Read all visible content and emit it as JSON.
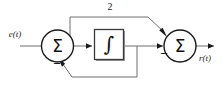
{
  "diagram": {
    "background_color": "#ffffff",
    "wire_color": "#6e6e6e",
    "outline_color": "#1a1a1a",
    "labels": {
      "input_signal": "e(t)",
      "output_signal": "r(t)",
      "feedforward_gain": "2",
      "summer_symbol": "Σ",
      "integrator_symbol": "∫",
      "minus_sign": "−"
    },
    "nodes": [
      {
        "name": "summing-junction-1",
        "symbol": "Σ",
        "signs": [
          "−",
          "−"
        ]
      },
      {
        "name": "integrator-block",
        "symbol": "∫"
      },
      {
        "name": "summing-junction-2",
        "symbol": "Σ",
        "signs": [
          "−"
        ]
      }
    ],
    "signs": {
      "summer1_bottom": "−",
      "summer1_feedback": "−",
      "summer2_left": "−"
    }
  }
}
